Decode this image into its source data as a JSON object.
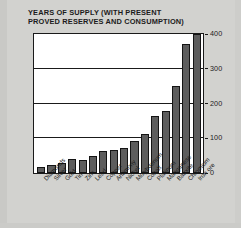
{
  "chart_data": {
    "type": "bar",
    "title": "YEARS OF SUPPLY (WITH PRESENT\nPROVED RESERVES AND CONSUMPTION)",
    "xlabel": "",
    "ylabel": "",
    "ylim": [
      0,
      400
    ],
    "yticks": [
      0,
      100,
      200,
      300,
      400
    ],
    "ytick_labels": [
      "0",
      "100",
      "200",
      "300",
      "400"
    ],
    "grid": true,
    "grid_axis": "y",
    "legend": false,
    "legend_position": "none",
    "bar_color": "#5d5d5d",
    "bar_edge_color": "#141414",
    "plot_background": "#ffffff",
    "figure_background": "#d2d2cf",
    "axis_color": "#1a1a1a",
    "title_color": "#1b1b1b",
    "categories": [
      "Diamonds",
      "Silver",
      "Gold",
      "Tin",
      "Zinc",
      "Lead",
      "Copper",
      "Antimony",
      "Nickel",
      "Molybdenum",
      "Cobalt",
      "Platinum",
      "Manganese",
      "Bauxite",
      "Chromium",
      "Iron ore"
    ],
    "values": [
      18,
      22,
      30,
      40,
      38,
      48,
      62,
      65,
      72,
      92,
      112,
      165,
      178,
      250,
      370,
      400
    ]
  }
}
